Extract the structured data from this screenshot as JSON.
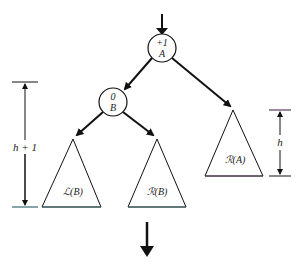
{
  "diagram": {
    "type": "avl-tree-rotation",
    "colors": {
      "stroke": "#111111",
      "base_line": "#3a6a70",
      "triangle_fill": "#ffffff"
    },
    "nodes": {
      "root": {
        "balance": "+1",
        "name": "A"
      },
      "child": {
        "balance": "0",
        "name": "B"
      }
    },
    "subtrees": {
      "left_of_b": {
        "label": "ℒ(B)"
      },
      "right_of_b": {
        "label": "ℛ(B)"
      },
      "right_of_a": {
        "label": "ℛ(A)"
      }
    },
    "dimensions": {
      "left_height": {
        "label": "h + 1"
      },
      "right_height": {
        "label": "h"
      }
    },
    "arrows": {
      "incoming": "down-arrow",
      "outgoing": "down-arrow"
    }
  }
}
